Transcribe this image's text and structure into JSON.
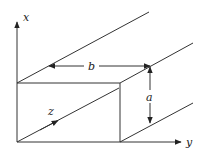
{
  "diagram": {
    "type": "rectangular waveguide coordinate sketch",
    "axes": {
      "x_label": "x",
      "y_label": "y",
      "z_label": "z"
    },
    "dimensions": {
      "width_label": "b",
      "height_label": "a"
    },
    "colors": {
      "line": "#333333",
      "text": "#222222",
      "background": "#ffffff"
    }
  }
}
